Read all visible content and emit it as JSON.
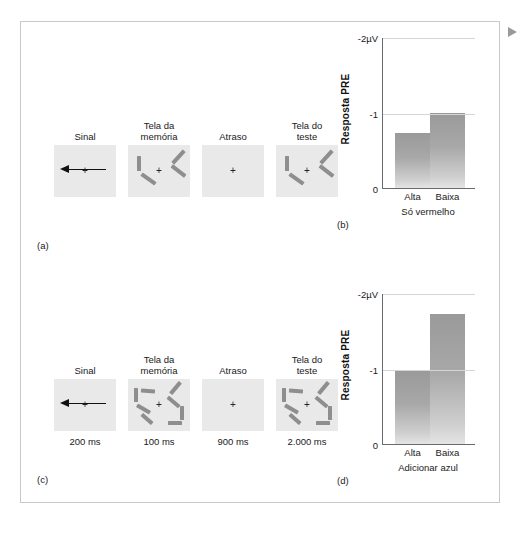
{
  "figure": {
    "marker_icon": "triangle-right-icon",
    "panel_labels": {
      "a": "(a)",
      "b": "(b)",
      "c": "(c)",
      "d": "(d)"
    }
  },
  "sequence_red_only": {
    "screens": [
      {
        "title": "Sinal",
        "name": "cue-screen",
        "fixation": "+",
        "arrow": "left-arrow-icon",
        "items": []
      },
      {
        "title": "Tela da\nmemória",
        "name": "memory-screen",
        "fixation": "+",
        "items": [
          {
            "left": 9,
            "top": 11,
            "w": 4,
            "h": 15,
            "rot": 0
          },
          {
            "left": 12,
            "top": 32,
            "w": 17,
            "h": 4,
            "rot": 35
          },
          {
            "left": 42,
            "top": 10,
            "w": 17,
            "h": 4,
            "rot": -48
          },
          {
            "left": 42,
            "top": 24,
            "w": 17,
            "h": 4,
            "rot": 38
          }
        ]
      },
      {
        "title": "Atraso",
        "name": "delay-screen",
        "fixation": "+",
        "items": []
      },
      {
        "title": "Tela do\nteste",
        "name": "test-screen",
        "fixation": "+",
        "items": [
          {
            "left": 9,
            "top": 11,
            "w": 4,
            "h": 15,
            "rot": 0
          },
          {
            "left": 12,
            "top": 32,
            "w": 17,
            "h": 4,
            "rot": 35
          },
          {
            "left": 42,
            "top": 10,
            "w": 17,
            "h": 4,
            "rot": -48
          },
          {
            "left": 42,
            "top": 24,
            "w": 17,
            "h": 4,
            "rot": 38
          }
        ]
      }
    ],
    "timings": []
  },
  "sequence_add_blue": {
    "screens": [
      {
        "title": "Sinal",
        "name": "cue-screen",
        "fixation": "+",
        "arrow": "left-arrow-icon",
        "items": []
      },
      {
        "title": "Tela da\nmemória",
        "name": "memory-screen",
        "fixation": "+",
        "items": [
          {
            "left": 6,
            "top": 9,
            "w": 4,
            "h": 14,
            "rot": 0
          },
          {
            "left": 13,
            "top": 10,
            "w": 14,
            "h": 4,
            "rot": 4
          },
          {
            "left": 8,
            "top": 28,
            "w": 15,
            "h": 4,
            "rot": 30
          },
          {
            "left": 12,
            "top": 38,
            "w": 14,
            "h": 4,
            "rot": 42
          },
          {
            "left": 40,
            "top": 7,
            "w": 15,
            "h": 4,
            "rot": -50
          },
          {
            "left": 38,
            "top": 21,
            "w": 15,
            "h": 4,
            "rot": 40
          },
          {
            "left": 52,
            "top": 27,
            "w": 4,
            "h": 14,
            "rot": 0
          },
          {
            "left": 40,
            "top": 42,
            "w": 14,
            "h": 4,
            "rot": 0
          }
        ]
      },
      {
        "title": "Atraso",
        "name": "delay-screen",
        "fixation": "+",
        "items": []
      },
      {
        "title": "Tela do\nteste",
        "name": "test-screen",
        "fixation": "+",
        "items": [
          {
            "left": 6,
            "top": 9,
            "w": 4,
            "h": 14,
            "rot": 0
          },
          {
            "left": 13,
            "top": 10,
            "w": 14,
            "h": 4,
            "rot": 4
          },
          {
            "left": 8,
            "top": 28,
            "w": 15,
            "h": 4,
            "rot": 30
          },
          {
            "left": 12,
            "top": 38,
            "w": 14,
            "h": 4,
            "rot": 42
          },
          {
            "left": 40,
            "top": 7,
            "w": 15,
            "h": 4,
            "rot": -50
          },
          {
            "left": 38,
            "top": 21,
            "w": 15,
            "h": 4,
            "rot": 40
          },
          {
            "left": 52,
            "top": 27,
            "w": 4,
            "h": 14,
            "rot": 0
          },
          {
            "left": 40,
            "top": 42,
            "w": 14,
            "h": 4,
            "rot": 0
          }
        ]
      }
    ],
    "timings": [
      "200 ms",
      "100 ms",
      "900 ms",
      "2.000 ms"
    ]
  },
  "chart_data": [
    {
      "type": "bar",
      "name": "red-only-chart",
      "title": "Só vermelho",
      "categories": [
        "Alta",
        "Baixa"
      ],
      "values": [
        -0.73,
        -1.0
      ],
      "xlabel": "",
      "ylabel": "Resposta PRE",
      "ylim": [
        0,
        -2
      ],
      "ytick_labels": [
        "-2µV",
        "-1",
        "0"
      ],
      "ytick_values": [
        -2,
        -1,
        0
      ],
      "grid": true,
      "legend": "none"
    },
    {
      "type": "bar",
      "name": "add-blue-chart",
      "title": "Adicionar azul",
      "categories": [
        "Alta",
        "Baixa"
      ],
      "values": [
        -0.97,
        -1.72
      ],
      "xlabel": "",
      "ylabel": "Resposta PRE",
      "ylim": [
        0,
        -2
      ],
      "ytick_labels": [
        "-2µV",
        "-1",
        "0"
      ],
      "ytick_values": [
        -2,
        -1,
        0
      ],
      "grid": true,
      "legend": "none"
    }
  ]
}
